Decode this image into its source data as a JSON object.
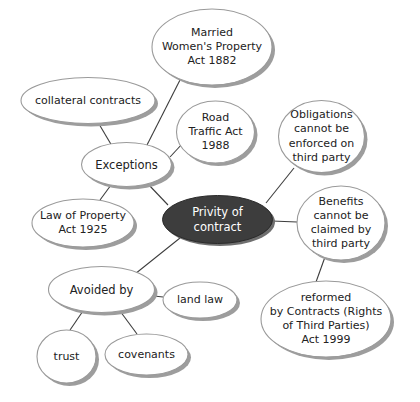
{
  "diagram": {
    "type": "mind-map",
    "background_color": "#ffffff",
    "edge_color": "#3c3c3c",
    "node_outline_color": "#9a9a9a",
    "node_shadow_color": "#9d9d9d",
    "node_fill_color": "#ffffff",
    "node_text_color": "#222222",
    "center_fill_color": "#3d3d3d",
    "center_text_color": "#ffffff",
    "nodes": [
      {
        "id": "center",
        "label": "Privity of contract",
        "lines": [
          "Privity of",
          "contract"
        ],
        "cx": 217.5,
        "cy": 219.5,
        "rx": 55,
        "ry": 24,
        "style": "center",
        "font_size": 11.5
      },
      {
        "id": "exceptions",
        "label": "Exceptions",
        "lines": [
          "Exceptions"
        ],
        "cx": 126.5,
        "cy": 164.5,
        "rx": 45,
        "ry": 22,
        "style": "normal",
        "font_size": 11.5
      },
      {
        "id": "collateral-contracts",
        "label": "collateral contracts",
        "lines": [
          "collateral contracts"
        ],
        "cx": 88,
        "cy": 100.5,
        "rx": 67,
        "ry": 23,
        "style": "normal",
        "font_size": 11
      },
      {
        "id": "married-womens-property-act-1882",
        "label": "Married Women's Property Act 1882",
        "lines": [
          "Married",
          "Women's Property",
          "Act 1882"
        ],
        "cx": 212,
        "cy": 47,
        "rx": 60,
        "ry": 38,
        "style": "normal",
        "font_size": 11
      },
      {
        "id": "road-traffic-act-1988",
        "label": "Road Traffic Act 1988",
        "lines": [
          "Road",
          "Traffic Act",
          "1988"
        ],
        "cx": 215.5,
        "cy": 132,
        "rx": 39,
        "ry": 31,
        "style": "normal",
        "font_size": 11
      },
      {
        "id": "law-of-property-act-1925",
        "label": "Law of Property Act 1925",
        "lines": [
          "Law of Property",
          "Act 1925"
        ],
        "cx": 83,
        "cy": 223,
        "rx": 51,
        "ry": 24,
        "style": "normal",
        "font_size": 11
      },
      {
        "id": "obligations-cannot-be-enforced",
        "label": "Obligations cannot be enforced on third party",
        "lines": [
          "Obligations",
          "cannot be",
          "enforced on",
          "third party"
        ],
        "cx": 321.5,
        "cy": 136.5,
        "rx": 43,
        "ry": 36,
        "style": "normal",
        "font_size": 11
      },
      {
        "id": "benefits-cannot-be-claimed",
        "label": "Benefits cannot be claimed by third party",
        "lines": [
          "Benefits",
          "cannot be",
          "claimed by",
          "third party"
        ],
        "cx": 341,
        "cy": 223,
        "rx": 44,
        "ry": 37,
        "style": "normal",
        "font_size": 11
      },
      {
        "id": "reformed-by-contracts-act-1999",
        "label": "reformed by Contracts (Rights of Third Parties) Act 1999",
        "lines": [
          "reformed",
          "by Contracts (Rights",
          "of Third Parties)",
          "Act 1999"
        ],
        "cx": 326,
        "cy": 319,
        "rx": 65,
        "ry": 38,
        "style": "normal",
        "font_size": 11
      },
      {
        "id": "avoided-by",
        "label": "Avoided by",
        "lines": [
          "Avoided by"
        ],
        "cx": 101.5,
        "cy": 289.5,
        "rx": 53,
        "ry": 23,
        "style": "normal",
        "font_size": 11.5
      },
      {
        "id": "land-law",
        "label": "land law",
        "lines": [
          "land law"
        ],
        "cx": 200,
        "cy": 300,
        "rx": 37,
        "ry": 18,
        "style": "normal",
        "font_size": 11
      },
      {
        "id": "trust",
        "label": "trust",
        "lines": [
          "trust"
        ],
        "cx": 66.5,
        "cy": 356.5,
        "rx": 29.5,
        "ry": 26.5,
        "style": "normal",
        "font_size": 11
      },
      {
        "id": "covenants",
        "label": "covenants",
        "lines": [
          "covenants"
        ],
        "cx": 146.5,
        "cy": 354.5,
        "rx": 41.5,
        "ry": 20.5,
        "style": "normal",
        "font_size": 11
      }
    ],
    "edges": [
      {
        "from": "center",
        "to": "exceptions",
        "x1": 168,
        "y1": 205,
        "x2": 148,
        "y2": 184
      },
      {
        "from": "center",
        "to": "obligations-cannot-be-enforced",
        "x1": 266,
        "y1": 203,
        "x2": 294,
        "y2": 168
      },
      {
        "from": "center",
        "to": "benefits-cannot-be-claimed",
        "x1": 272,
        "y1": 221,
        "x2": 297,
        "y2": 222
      },
      {
        "from": "center",
        "to": "avoided-by",
        "x1": 180,
        "y1": 238,
        "x2": 135,
        "y2": 274
      },
      {
        "from": "exceptions",
        "to": "collateral-contracts",
        "x1": 112,
        "y1": 146,
        "x2": 99,
        "y2": 124
      },
      {
        "from": "exceptions",
        "to": "married-womens-property-act-1882",
        "x1": 147,
        "y1": 145,
        "x2": 180,
        "y2": 80
      },
      {
        "from": "exceptions",
        "to": "road-traffic-act-1988",
        "x1": 170,
        "y1": 157,
        "x2": 183,
        "y2": 143
      },
      {
        "from": "exceptions",
        "to": "law-of-property-act-1925",
        "x1": 111,
        "y1": 185,
        "x2": 100,
        "y2": 200
      },
      {
        "from": "benefits-cannot-be-claimed",
        "to": "reformed-by-contracts-act-1999",
        "x1": 325,
        "y1": 257,
        "x2": 316,
        "y2": 282
      },
      {
        "from": "avoided-by",
        "to": "land-law",
        "x1": 154,
        "y1": 296,
        "x2": 163,
        "y2": 297
      },
      {
        "from": "avoided-by",
        "to": "trust",
        "x1": 83,
        "y1": 311,
        "x2": 70,
        "y2": 330
      },
      {
        "from": "avoided-by",
        "to": "covenants",
        "x1": 120,
        "y1": 311,
        "x2": 137,
        "y2": 334
      }
    ]
  }
}
